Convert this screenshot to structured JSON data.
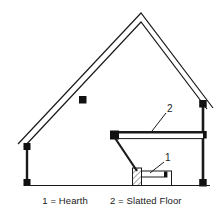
{
  "figure": {
    "kind": "architectural-cross-section",
    "background_color": "#ffffff",
    "line_color": "#1a1a1a",
    "fill_white": "#ffffff",
    "marker_color": "#111111"
  },
  "callouts": {
    "hearth_number": "1",
    "slatted_floor_number": "2"
  },
  "legend": {
    "hearth": "1 = Hearth",
    "slatted_floor": "2 = Slatted Floor"
  },
  "parts": {
    "roof_label": "gabled-roof",
    "left_wall_label": "left-wall",
    "right_wall_label": "right-wall",
    "ground_label": "ground-line",
    "slatted_floor_label": "slatted-floor-platform",
    "chute_label": "chute-slope",
    "hearth_label": "hearth-block"
  }
}
